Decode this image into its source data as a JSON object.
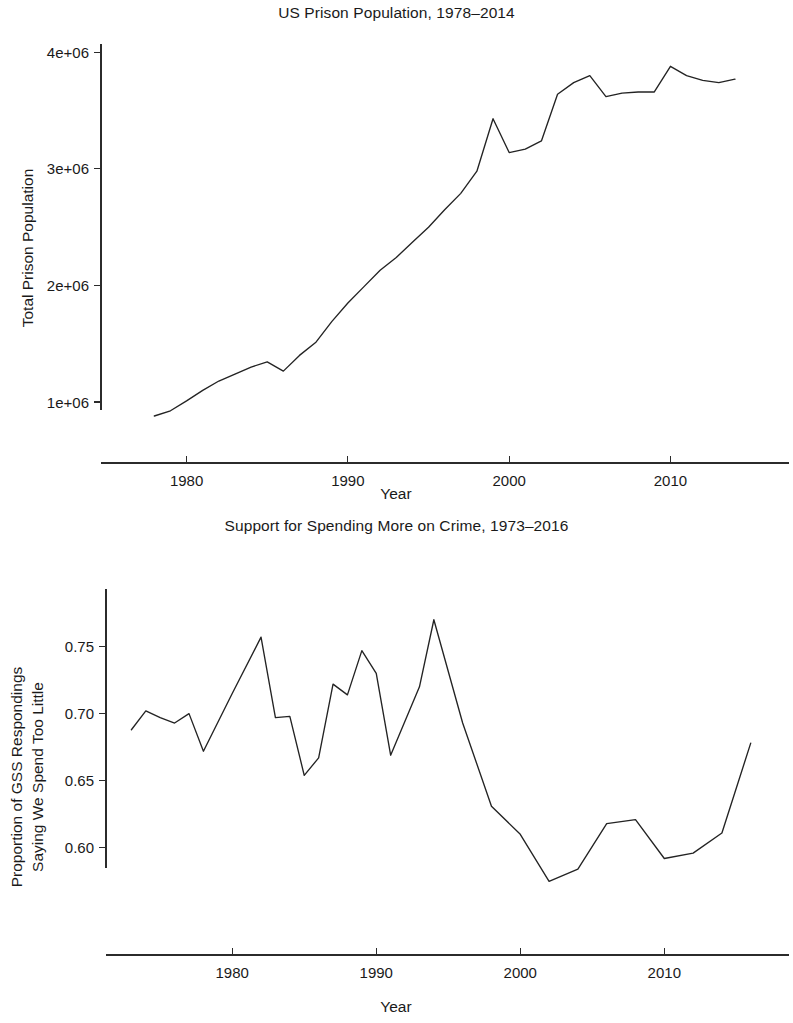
{
  "figure": {
    "background_color": "#ffffff",
    "line_color": "#232323",
    "axis_color": "#2b2b2b",
    "text_color": "#1a1a1a"
  },
  "panels": {
    "top": {
      "title": "US Prison Population, 1978–2014",
      "xlabel": "Year",
      "ylabel": "Total Prison Population"
    },
    "bottom": {
      "title": "Support for Spending More on Crime, 1973–2016",
      "xlabel": "Year",
      "ylabel_line1": "Proportion of GSS Respondings",
      "ylabel_line2": "Saying We Spend Too Little"
    }
  },
  "chart_data": [
    {
      "id": "us-prison-population",
      "type": "line",
      "title": "US Prison Population, 1978–2014",
      "xlabel": "Year",
      "ylabel": "Total Prison Population",
      "grid": false,
      "legend": "none",
      "xlim": [
        1975.5,
        2015.8
      ],
      "ylim": [
        760000,
        4080000
      ],
      "xticks": [
        1980,
        1990,
        2000,
        2010
      ],
      "xticklabels": [
        "1980",
        "1990",
        "2000",
        "2010"
      ],
      "yticks": [
        1000000,
        2000000,
        3000000,
        4000000
      ],
      "yticklabels": [
        "1e+06",
        "2e+06",
        "3e+06",
        "4e+06"
      ],
      "x": [
        1978,
        1979,
        1980,
        1981,
        1982,
        1983,
        1984,
        1985,
        1986,
        1987,
        1988,
        1989,
        1990,
        1991,
        1992,
        1993,
        1994,
        1995,
        1996,
        1997,
        1998,
        1999,
        2000,
        2001,
        2002,
        2003,
        2004,
        2005,
        2006,
        2007,
        2008,
        2009,
        2010,
        2011,
        2012,
        2013,
        2014
      ],
      "values": [
        880000,
        925000,
        1010000,
        1100000,
        1180000,
        1240000,
        1300000,
        1345000,
        1265000,
        1400000,
        1510000,
        1690000,
        1850000,
        1990000,
        2130000,
        2240000,
        2370000,
        2500000,
        2650000,
        2790000,
        2980000,
        3430000,
        3140000,
        3170000,
        3240000,
        3640000,
        3740000,
        3800000,
        3620000,
        3650000,
        3660000,
        3660000,
        3880000,
        3800000,
        3760000,
        3740000,
        3770000
      ],
      "annotations": []
    },
    {
      "id": "support-spending-more-on-crime",
      "type": "line",
      "title": "Support for Spending More on Crime, 1973–2016",
      "xlabel": "Year",
      "ylabel": "Proportion of GSS Respondings Saying We Spend Too Little",
      "grid": false,
      "legend": "none",
      "xlim": [
        1972.0,
        2017.2
      ],
      "ylim": [
        0.5685,
        0.7795
      ],
      "xticks": [
        1980,
        1990,
        2000,
        2010
      ],
      "xticklabels": [
        "1980",
        "1990",
        "2000",
        "2010"
      ],
      "yticks": [
        0.6,
        0.65,
        0.7,
        0.75
      ],
      "yticklabels": [
        "0.60",
        "0.65",
        "0.70",
        "0.75"
      ],
      "x": [
        1973,
        1974,
        1975,
        1976,
        1977,
        1978,
        1980,
        1982,
        1983,
        1984,
        1985,
        1986,
        1987,
        1988,
        1989,
        1990,
        1991,
        1993,
        1994,
        1996,
        1998,
        2000,
        2002,
        2004,
        2006,
        2008,
        2010,
        2012,
        2014,
        2016
      ],
      "values": [
        0.688,
        0.702,
        0.697,
        0.693,
        0.7,
        0.672,
        0.715,
        0.757,
        0.697,
        0.698,
        0.654,
        0.667,
        0.722,
        0.714,
        0.747,
        0.73,
        0.669,
        0.72,
        0.77,
        0.693,
        0.631,
        0.61,
        0.575,
        0.584,
        0.618,
        0.621,
        0.592,
        0.596,
        0.611,
        0.678
      ],
      "annotations": []
    }
  ]
}
